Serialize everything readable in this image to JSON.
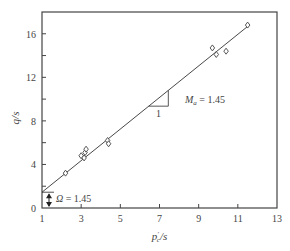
{
  "chart_data": {
    "type": "scatter",
    "title": "",
    "xlabel": "p'_c/s",
    "ylabel": "q/s",
    "xlim": [
      1,
      13
    ],
    "ylim": [
      0,
      18
    ],
    "grid": false,
    "legend": null,
    "x_ticks": [
      1,
      3,
      5,
      7,
      9,
      11,
      13
    ],
    "y_ticks": [
      0,
      4,
      8,
      12,
      16
    ],
    "x_tick_labels": [
      "1",
      "3",
      "5",
      "7",
      "9",
      "11",
      "13"
    ],
    "y_tick_labels": [
      "0",
      "4",
      "8",
      "12",
      "16"
    ],
    "series": [
      {
        "name": "data",
        "marker": "diamond-open",
        "points": [
          {
            "x": 2.2,
            "y": 3.2
          },
          {
            "x": 3.0,
            "y": 4.8
          },
          {
            "x": 3.15,
            "y": 4.6
          },
          {
            "x": 3.2,
            "y": 5.1
          },
          {
            "x": 3.25,
            "y": 5.4
          },
          {
            "x": 4.35,
            "y": 6.2
          },
          {
            "x": 4.4,
            "y": 5.9
          },
          {
            "x": 9.7,
            "y": 14.7
          },
          {
            "x": 9.9,
            "y": 14.1
          },
          {
            "x": 10.4,
            "y": 14.4
          },
          {
            "x": 11.5,
            "y": 16.8
          }
        ]
      },
      {
        "name": "fit",
        "type": "line",
        "slope": 1.45,
        "intercept_at_x1": 1.45,
        "x": [
          1,
          11.6
        ],
        "y": [
          1.45,
          16.82
        ]
      }
    ],
    "annotations": [
      {
        "text": "M_a = 1.45",
        "label_main": "M",
        "label_sub": "a",
        "label_rest": " = 1.45",
        "x": 8.3,
        "y": 9.6
      },
      {
        "text": "1",
        "x": 7.4,
        "y": 8.4
      },
      {
        "text": "Ω = 1.45",
        "label_main": "Ω",
        "label_rest": " = 1.45",
        "x": 1.9,
        "y": 1.0
      }
    ]
  }
}
